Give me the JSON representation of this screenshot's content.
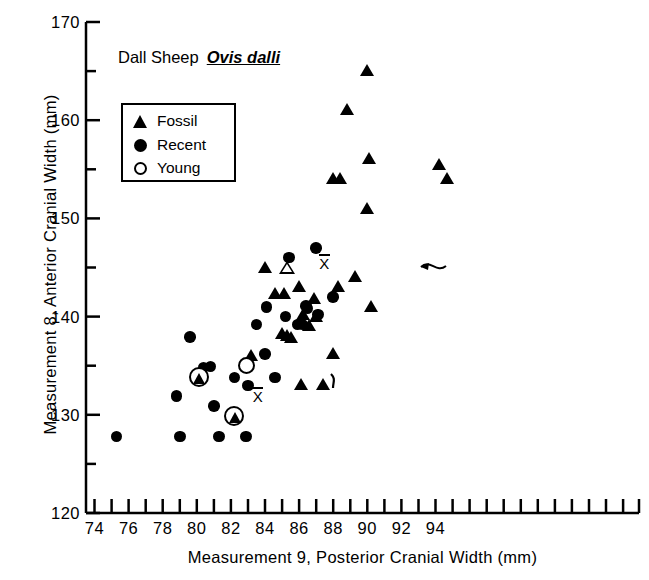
{
  "chart_data": {
    "type": "scatter",
    "title_prefix": "Dall Sheep",
    "title_species": "Ovis dalli",
    "xlabel": "Measurement 9, Posterior Cranial Width  (mm)",
    "ylabel": "Measurement 8, Anterior Cranial Width (mm)",
    "xlim": [
      73,
      95
    ],
    "ylim": [
      120,
      170
    ],
    "x_major_ticks": [
      74,
      76,
      78,
      80,
      82,
      84,
      86,
      88,
      90,
      92,
      94
    ],
    "x_minor_ticks": [
      73,
      75,
      77,
      79,
      81,
      83,
      85,
      87,
      89,
      91,
      93,
      95
    ],
    "y_major_ticks": [
      120,
      130,
      140,
      150,
      160,
      170
    ],
    "y_minor_ticks": [
      125,
      135,
      145,
      155,
      165
    ],
    "grid": false,
    "legend_position": "upper-left",
    "legend": [
      {
        "marker": "filled-triangle",
        "label": "Fossil"
      },
      {
        "marker": "filled-circle",
        "label": "Recent"
      },
      {
        "marker": "open-circle",
        "label": "Young"
      }
    ],
    "series": [
      {
        "name": "Fossil",
        "marker": "filled-triangle",
        "points": [
          [
            83.2,
            136.0
          ],
          [
            84.0,
            145.0
          ],
          [
            84.6,
            142.3
          ],
          [
            85.1,
            142.3
          ],
          [
            85.0,
            138.2
          ],
          [
            85.3,
            138.0
          ],
          [
            85.5,
            137.8
          ],
          [
            86.0,
            143.0
          ],
          [
            86.2,
            140.2
          ],
          [
            86.6,
            139.0
          ],
          [
            86.9,
            141.8
          ],
          [
            87.0,
            140.0
          ],
          [
            86.1,
            133.0
          ],
          [
            87.4,
            133.0
          ],
          [
            88.0,
            136.2
          ],
          [
            88.3,
            143.0
          ],
          [
            88.0,
            154.0
          ],
          [
            88.4,
            154.0
          ],
          [
            88.8,
            161.0
          ],
          [
            89.3,
            144.0
          ],
          [
            90.0,
            165.0
          ],
          [
            90.1,
            156.0
          ],
          [
            90.0,
            151.0
          ],
          [
            90.2,
            141.0
          ],
          [
            94.2,
            155.4
          ],
          [
            94.7,
            154.0
          ]
        ]
      },
      {
        "name": "Recent",
        "marker": "filled-circle",
        "points": [
          [
            75.3,
            127.8
          ],
          [
            78.8,
            131.9
          ],
          [
            79.0,
            127.8
          ],
          [
            79.6,
            137.9
          ],
          [
            80.4,
            134.8
          ],
          [
            80.8,
            134.9
          ],
          [
            81.0,
            130.9
          ],
          [
            81.3,
            127.8
          ],
          [
            82.2,
            133.8
          ],
          [
            82.9,
            127.8
          ],
          [
            83.0,
            133.0
          ],
          [
            83.5,
            139.2
          ],
          [
            84.0,
            136.2
          ],
          [
            84.1,
            141.0
          ],
          [
            84.6,
            133.8
          ],
          [
            85.2,
            140.0
          ],
          [
            85.4,
            146.0
          ],
          [
            85.9,
            139.2
          ],
          [
            86.2,
            139.2
          ],
          [
            86.4,
            141.1
          ],
          [
            86.5,
            140.8
          ],
          [
            87.0,
            147.0
          ],
          [
            87.1,
            140.2
          ],
          [
            88.0,
            142.0
          ]
        ]
      },
      {
        "name": "Young",
        "marker": "open-circle",
        "note": "young individuals, shown circled around their base symbol",
        "points": [
          [
            80.1,
            133.9,
            "fossil"
          ],
          [
            82.2,
            129.9,
            "fossil"
          ]
        ]
      }
    ],
    "annotations": [
      {
        "name": "fossil-mean",
        "marker": "open-triangle",
        "x": 85.3,
        "y": 145.0,
        "label": "X̄",
        "label_x": 87.5,
        "label_y": 145.6,
        "connector": "curved-arrow"
      },
      {
        "name": "recent-mean",
        "marker": "open-circle",
        "x": 82.9,
        "y": 135.0,
        "label": "X̄",
        "label_x": 83.6,
        "label_y": 132.0,
        "connector": "hooked-line"
      }
    ]
  }
}
